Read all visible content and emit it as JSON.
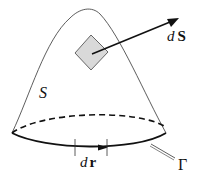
{
  "diagram": {
    "labels": {
      "surface": "S",
      "area_element_d": "d",
      "area_element_vec": "S",
      "line_element_d": "d",
      "line_element_vec": "r",
      "boundary": "Γ"
    },
    "colors": {
      "stroke": "#111111",
      "patch_fill": "#d9d9d9",
      "background": "#ffffff"
    }
  }
}
